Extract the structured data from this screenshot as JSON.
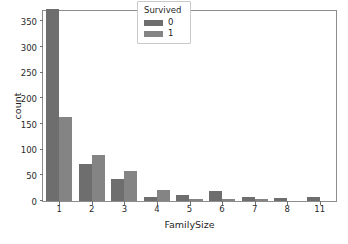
{
  "chart_data": {
    "type": "bar",
    "title": "",
    "xlabel": "FamilySize",
    "ylabel": "count",
    "categories": [
      "1",
      "2",
      "3",
      "4",
      "5",
      "6",
      "7",
      "8",
      "11"
    ],
    "series": [
      {
        "name": "0",
        "color": "#6e6e6e",
        "values": [
          374,
          72,
          43,
          8,
          12,
          19,
          8,
          6,
          7
        ]
      },
      {
        "name": "1",
        "color": "#848484",
        "values": [
          163,
          89,
          59,
          21,
          3,
          3,
          4,
          0,
          0
        ]
      }
    ],
    "legend": {
      "title": "Survived",
      "position": "upper center",
      "entries": [
        "0",
        "1"
      ]
    },
    "yticks": [
      0,
      50,
      100,
      150,
      200,
      250,
      300,
      350
    ],
    "ylim": [
      0,
      370
    ],
    "xticklabels": [
      "1",
      "2",
      "3",
      "4",
      "5",
      "6",
      "7",
      "8",
      "11"
    ],
    "grid": false
  },
  "figure": {
    "background": "#ffffff",
    "spine_color": "#8d8d8d",
    "tick_color": "#6f6f6f",
    "text_color": "#1f1f1f"
  }
}
